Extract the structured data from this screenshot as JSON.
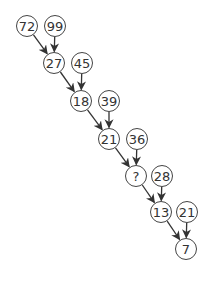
{
  "diagram": {
    "type": "number-chain-puzzle",
    "node_radius": 10.5,
    "colors": {
      "stroke": "#444444",
      "text": "#333333",
      "background": "#ffffff"
    },
    "nodes": [
      {
        "id": "n1",
        "label": "72",
        "x": 27,
        "y": 26
      },
      {
        "id": "n2",
        "label": "99",
        "x": 55,
        "y": 26
      },
      {
        "id": "n3",
        "label": "27",
        "x": 54,
        "y": 63
      },
      {
        "id": "n4",
        "label": "45",
        "x": 82,
        "y": 63
      },
      {
        "id": "n5",
        "label": "18",
        "x": 81,
        "y": 101
      },
      {
        "id": "n6",
        "label": "39",
        "x": 109,
        "y": 101
      },
      {
        "id": "n7",
        "label": "21",
        "x": 109,
        "y": 139
      },
      {
        "id": "n8",
        "label": "36",
        "x": 137,
        "y": 139
      },
      {
        "id": "n9",
        "label": "?",
        "x": 136,
        "y": 176
      },
      {
        "id": "n10",
        "label": "28",
        "x": 162,
        "y": 176
      },
      {
        "id": "n11",
        "label": "13",
        "x": 161,
        "y": 212
      },
      {
        "id": "n12",
        "label": "21",
        "x": 187,
        "y": 212
      },
      {
        "id": "n13",
        "label": "7",
        "x": 186,
        "y": 249
      }
    ],
    "edges": [
      {
        "from": "n1",
        "to": "n3"
      },
      {
        "from": "n2",
        "to": "n3"
      },
      {
        "from": "n3",
        "to": "n5"
      },
      {
        "from": "n4",
        "to": "n5"
      },
      {
        "from": "n5",
        "to": "n7"
      },
      {
        "from": "n6",
        "to": "n7"
      },
      {
        "from": "n7",
        "to": "n9"
      },
      {
        "from": "n8",
        "to": "n9"
      },
      {
        "from": "n9",
        "to": "n11"
      },
      {
        "from": "n10",
        "to": "n11"
      },
      {
        "from": "n11",
        "to": "n13"
      },
      {
        "from": "n12",
        "to": "n13"
      }
    ]
  }
}
